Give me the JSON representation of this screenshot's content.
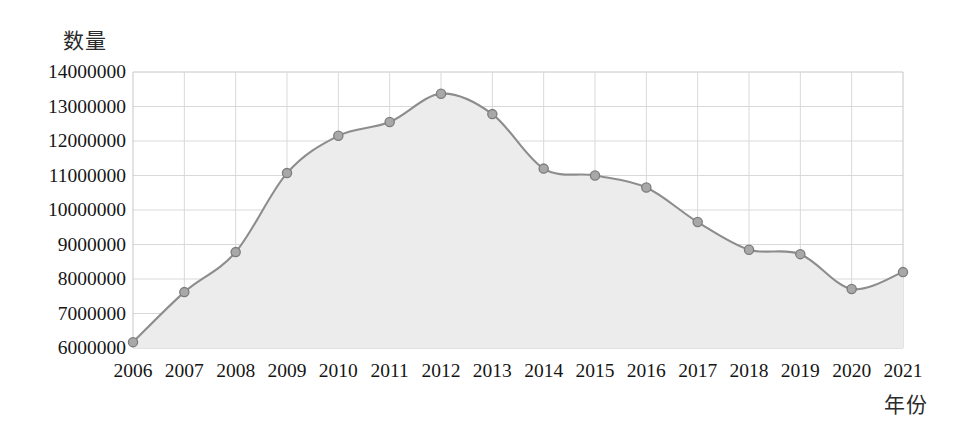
{
  "chart_data": {
    "type": "area",
    "title": "",
    "subtitle": "",
    "xlabel": "年份",
    "ylabel": "数量",
    "categories": [
      "2006",
      "2007",
      "2008",
      "2009",
      "2010",
      "2011",
      "2012",
      "2013",
      "2014",
      "2015",
      "2016",
      "2017",
      "2018",
      "2019",
      "2020",
      "2021"
    ],
    "x": [
      2006,
      2007,
      2008,
      2009,
      2010,
      2011,
      2012,
      2013,
      2014,
      2015,
      2016,
      2017,
      2018,
      2019,
      2020,
      2021
    ],
    "values": [
      6170000,
      7620000,
      8780000,
      11070000,
      12150000,
      12550000,
      13370000,
      12780000,
      11200000,
      11000000,
      10650000,
      9650000,
      8850000,
      8720000,
      7710000,
      8200000
    ],
    "series": [
      {
        "name": "数量",
        "values": [
          6170000,
          7620000,
          8780000,
          11070000,
          12150000,
          12550000,
          13370000,
          12780000,
          11200000,
          11000000,
          10650000,
          9650000,
          8850000,
          8720000,
          7710000,
          8200000
        ]
      }
    ],
    "ylim": [
      6000000,
      14000000
    ],
    "ytick_values": [
      14000000,
      13000000,
      12000000,
      11000000,
      10000000,
      9000000,
      8000000,
      7000000,
      6000000
    ],
    "ytick_labels": [
      "14000000",
      "13000000",
      "12000000",
      "11000000",
      "10000000",
      "9000000",
      "8000000",
      "7000000",
      "6000000"
    ],
    "xtick_labels": [
      "2006",
      "2007",
      "2008",
      "2009",
      "2010",
      "2011",
      "2012",
      "2013",
      "2014",
      "2015",
      "2016",
      "2017",
      "2018",
      "2019",
      "2020",
      "2021"
    ],
    "grid": true,
    "legend": false,
    "legend_position": "none",
    "markers": true,
    "colors": {
      "line": "#8d8d8d",
      "marker_fill": "#a8a8a8",
      "marker_stroke": "#7c7c7c",
      "area_fill": "#ececec",
      "grid": "#d9d9d9",
      "axis": "#c6c6c6",
      "text": "#151515",
      "background": "#ffffff"
    }
  }
}
